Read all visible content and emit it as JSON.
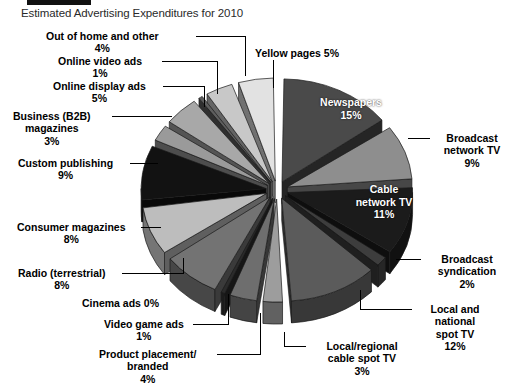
{
  "banner": {
    "present": true,
    "color": "#111111"
  },
  "title": "Estimated Advertising Expenditures for 2010",
  "background": "#ffffff",
  "chart_data": {
    "type": "pie",
    "title": "Estimated Advertising Expenditures for 2010",
    "xlabel": "",
    "ylabel": "",
    "value_unit": "percent",
    "exploded": true,
    "three_d": true,
    "legend_position": "callout-labels",
    "grid": false,
    "categories": [
      "Newspapers",
      "Broadcast network TV",
      "Cable network TV",
      "Broadcast syndication",
      "Local and national spot TV",
      "Local/regional cable spot TV",
      "Product placement/branded",
      "Video game ads",
      "Cinema ads",
      "Radio (terrestrial)",
      "Consumer magazines",
      "Custom publishing",
      "Business (B2B) magazines",
      "Online display ads",
      "Online video ads",
      "Out of home and other",
      "Yellow pages"
    ],
    "values": [
      15,
      9,
      11,
      2,
      12,
      3,
      4,
      1,
      0,
      8,
      8,
      9,
      3,
      5,
      1,
      4,
      5
    ],
    "labels": [
      "Newspapers 15%",
      "Broadcast network TV 9%",
      "Cable network TV 11%",
      "Broadcast syndication 2%",
      "Local and national spot TV 12%",
      "Local/regional cable spot TV 3%",
      "Product placement/branded 4%",
      "Video game ads 1%",
      "Cinema ads 0%",
      "Radio (terrestrial) 8%",
      "Consumer magazines 8%",
      "Custom publishing 9%",
      "Business (B2B) magazines 3%",
      "Online display ads 5%",
      "Online video ads 1%",
      "Out of home and other 4%",
      "Yellow pages 5%"
    ],
    "colors": [
      "#4a4a4a",
      "#8e8e8e",
      "#1b1b1b",
      "#3d3d3d",
      "#5b5b5b",
      "#9d9d9d",
      "#6e6e6e",
      "#2b2b2b",
      "#141414",
      "#737373",
      "#bdbdbd",
      "#121212",
      "#9a9a9a",
      "#a8a8a8",
      "#5e5e5e",
      "#c8c8c8",
      "#e2e2e2"
    ]
  },
  "callouts": {
    "out_of_home": {
      "name": "Out of home and other",
      "pct": "4%"
    },
    "online_video": {
      "name": "Online video ads",
      "pct": "1%"
    },
    "online_display": {
      "name": "Online display ads",
      "pct": "5%"
    },
    "b2b_line1": "Business (B2B)",
    "b2b_line2": "magazines",
    "b2b_pct": "3%",
    "custom_publishing": {
      "name": "Custom publishing",
      "pct": "9%"
    },
    "consumer_magazines": {
      "name": "Consumer magazines",
      "pct": "8%"
    },
    "radio": {
      "name": "Radio (terrestrial)",
      "pct": "8%"
    },
    "cinema": "Cinema ads 0%",
    "video_game": {
      "name": "Video game ads",
      "pct": "1%"
    },
    "product_placement_line1": "Product placement/",
    "product_placement_line2": "branded",
    "product_placement_pct": "4%",
    "yellow_pages": "Yellow pages 5%",
    "newspapers": {
      "name": "Newspapers",
      "pct": "15%"
    },
    "broadcast_network_line1": "Broadcast",
    "broadcast_network_line2": "network TV",
    "broadcast_network_pct": "9%",
    "cable_network_line1": "Cable",
    "cable_network_line2": "network TV",
    "cable_network_pct": "11%",
    "broadcast_synd_line1": "Broadcast",
    "broadcast_synd_line2": "syndication",
    "broadcast_synd_pct": "2%",
    "local_national_line1": "Local and",
    "local_national_line2": "national",
    "local_national_line3": "spot TV",
    "local_national_pct": "12%",
    "local_regional_line1": "Local/regional",
    "local_regional_line2": "cable spot TV",
    "local_regional_pct": "3%"
  }
}
